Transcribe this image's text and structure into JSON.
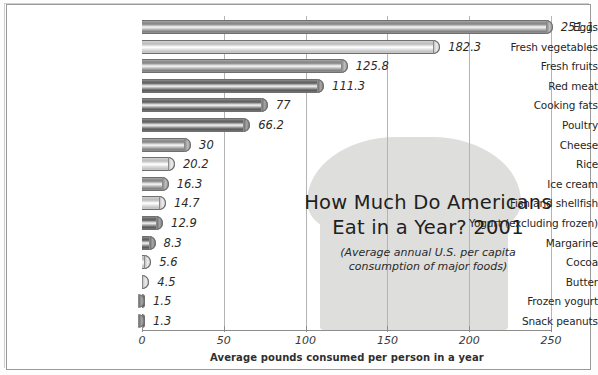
{
  "chart_data": {
    "type": "bar",
    "orientation": "horizontal",
    "title": "How Much Do Americans Eat in a Year? 2001",
    "title_line1": "How Much Do Americans",
    "title_line2": "Eat in a Year? 2001",
    "subtitle_line1": "(Average annual U.S. per capita",
    "subtitle_line2": "consumption of major foods)",
    "xlabel": "Average pounds consumed per person in a year",
    "ylabel": "",
    "xlim": [
      0,
      260
    ],
    "xticks": [
      0,
      50,
      100,
      150,
      200,
      250
    ],
    "xtick_labels": [
      "0",
      "50",
      "100",
      "150",
      "200",
      "250"
    ],
    "grid": true,
    "grid_axis": "x",
    "legend": "none",
    "categories": [
      "Eggs",
      "Fresh vegetables",
      "Fresh fruits",
      "Red meat",
      "Cooking fats",
      "Poultry",
      "Cheese",
      "Rice",
      "Ice cream",
      "Fish and shellfish",
      "Yogurt (excluding frozen)",
      "Margarine",
      "Cocoa",
      "Butter",
      "Frozen yogurt",
      "Snack peanuts"
    ],
    "values": [
      251.1,
      182.3,
      125.8,
      111.3,
      77,
      66.2,
      30,
      20.2,
      16.3,
      14.7,
      12.9,
      8.3,
      5.6,
      4.5,
      1.5,
      1.3
    ],
    "value_labels": [
      "251.1",
      "182.3",
      "125.8",
      "111.3",
      "77",
      "66.2",
      "30",
      "20.2",
      "16.3",
      "14.7",
      "12.9",
      "8.3",
      "5.6",
      "4.5",
      "1.5",
      "1.3"
    ],
    "bar_shades": [
      "mid",
      "light",
      "mid",
      "dark",
      "dark",
      "dark",
      "mid",
      "light",
      "mid",
      "light",
      "dark",
      "dark",
      "light",
      "light",
      "dark",
      "dark"
    ]
  },
  "decoration": {
    "bread_shape_label": "bread-slice-silhouette",
    "bread_color": "#dededc"
  },
  "colors": {
    "frame": "#9a9a9a",
    "gridline": "#b4b4b4",
    "axis": "#8d8d8d",
    "text": "#262626",
    "background": "#ffffff"
  }
}
